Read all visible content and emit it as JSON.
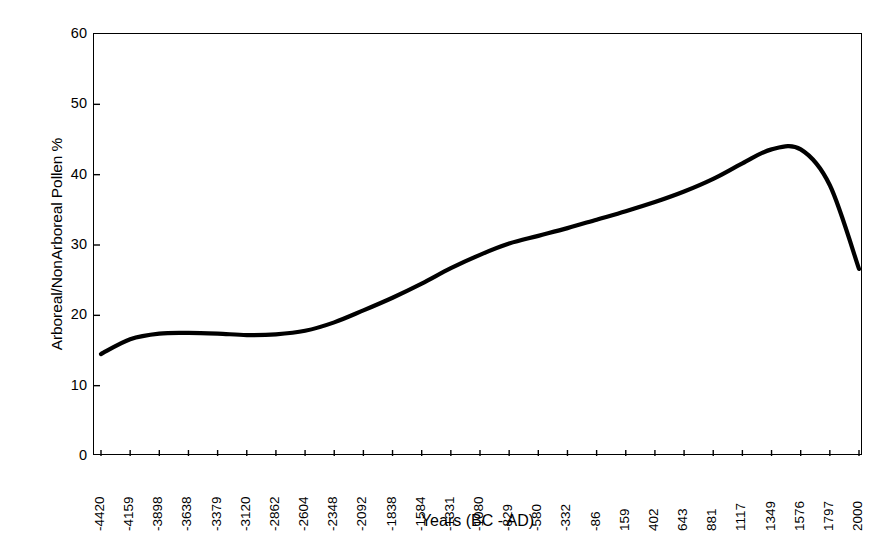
{
  "chart_data": {
    "type": "line",
    "title": "",
    "xlabel": "Years (BC - AD)",
    "ylabel": "Arboreal/NonArboreal Pollen %",
    "ylim": [
      0,
      60
    ],
    "yticks": [
      0,
      10,
      20,
      30,
      40,
      50,
      60
    ],
    "grid": false,
    "legend": "none",
    "line_color": "#000000",
    "line_width": 4.2,
    "background_color": "#ffffff",
    "axis_color": "#000000",
    "categories": [
      "-4420",
      "-4159",
      "-3898",
      "-3638",
      "-3379",
      "-3120",
      "-2862",
      "-2604",
      "-2348",
      "-2092",
      "-1838",
      "-1584",
      "-1331",
      "-1080",
      "-829",
      "-580",
      "-332",
      "-86",
      "159",
      "402",
      "643",
      "881",
      "1117",
      "1349",
      "1576",
      "1797",
      "2000"
    ],
    "values": [
      14.5,
      16.6,
      17.4,
      17.5,
      17.4,
      17.2,
      17.3,
      17.8,
      19.0,
      20.7,
      22.5,
      24.5,
      26.7,
      28.6,
      30.2,
      31.3,
      32.4,
      33.6,
      34.8,
      36.1,
      37.6,
      39.4,
      41.6,
      43.6,
      43.6,
      38.5,
      26.6
    ],
    "series": [
      {
        "name": "Arboreal/NonArboreal Pollen %",
        "values": [
          14.5,
          16.6,
          17.4,
          17.5,
          17.4,
          17.2,
          17.3,
          17.8,
          19.0,
          20.7,
          22.5,
          24.5,
          26.7,
          28.6,
          30.2,
          31.3,
          32.4,
          33.6,
          34.8,
          36.1,
          37.6,
          39.4,
          41.6,
          43.6,
          43.6,
          38.5,
          26.6
        ]
      }
    ],
    "annotations": {
      "start_value": 14.5,
      "peak_value": 43.8,
      "peak_category": "1349",
      "end_value": 26.6
    }
  }
}
